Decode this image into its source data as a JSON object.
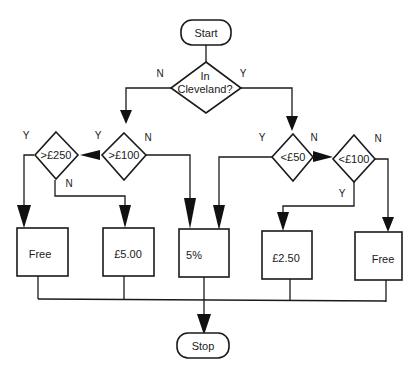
{
  "diagram": {
    "type": "flowchart",
    "terminals": {
      "start": "Start",
      "stop": "Stop"
    },
    "decisions": {
      "in_cleveland": {
        "line1": "In",
        "line2": "Cleveland?"
      },
      "gt100": ">£100",
      "gt250": ">£250",
      "lt50": "<£50",
      "lt100": "<£100"
    },
    "outcomes": {
      "free_left": "Free",
      "five_pounds": "£5.00",
      "five_percent": "5%",
      "two_fifty": "£2.50",
      "free_right": "Free"
    },
    "branch_labels": {
      "cleveland_no": "N",
      "cleveland_yes": "Y",
      "gt100_yes": "Y",
      "gt100_no": "N",
      "gt250_yes": "Y",
      "gt250_no": "N",
      "lt50_yes": "Y",
      "lt50_no": "N",
      "lt100_no": "N",
      "lt100_yes": "Y"
    },
    "edges": [
      {
        "from": "Start",
        "to": "In Cleveland?"
      },
      {
        "from": "In Cleveland?",
        "to": ">£100",
        "label": "N"
      },
      {
        "from": "In Cleveland?",
        "to": "<£50",
        "label": "Y"
      },
      {
        "from": ">£100",
        "to": ">£250",
        "label": "Y"
      },
      {
        "from": ">£100",
        "to": "5%",
        "label": "N"
      },
      {
        "from": ">£250",
        "to": "Free",
        "label": "Y"
      },
      {
        "from": ">£250",
        "to": "£5.00",
        "label": "N"
      },
      {
        "from": "<£50",
        "to": "5%",
        "label": "Y"
      },
      {
        "from": "<£50",
        "to": "<£100",
        "label": "N"
      },
      {
        "from": "<£100",
        "to": "£2.50",
        "label": "Y"
      },
      {
        "from": "<£100",
        "to": "Free",
        "label": "N"
      },
      {
        "from": "Free",
        "to": "Stop"
      },
      {
        "from": "£5.00",
        "to": "Stop"
      },
      {
        "from": "5%",
        "to": "Stop"
      },
      {
        "from": "£2.50",
        "to": "Stop"
      },
      {
        "from": "Free",
        "to": "Stop"
      }
    ]
  }
}
